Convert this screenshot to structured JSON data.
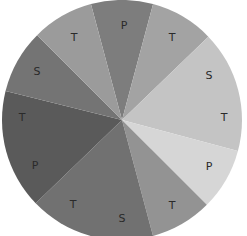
{
  "wheel": {
    "center": [
      122,
      120
    ],
    "radius": 120,
    "segments": [
      {
        "start": -15,
        "end": 15,
        "color": "#7d7d7d",
        "labels": [
          "P"
        ]
      },
      {
        "start": 15,
        "end": 46,
        "color": "#a3a3a3",
        "labels": [
          "T"
        ]
      },
      {
        "start": 46,
        "end": 105,
        "color": "#c4c4c4",
        "labels": [
          "S",
          "T"
        ]
      },
      {
        "start": 105,
        "end": 135,
        "color": "#d6d6d6",
        "labels": [
          "P"
        ]
      },
      {
        "start": 135,
        "end": 165,
        "color": "#939393",
        "labels": [
          "T"
        ]
      },
      {
        "start": 165,
        "end": 226,
        "color": "#717171",
        "labels": [
          "S",
          "T"
        ]
      },
      {
        "start": 226,
        "end": 284,
        "color": "#5a5a5a",
        "labels": [
          "P",
          "T"
        ]
      },
      {
        "start": 284,
        "end": 315,
        "color": "#747474",
        "labels": [
          "S"
        ]
      },
      {
        "start": 315,
        "end": 345,
        "color": "#9b9b9b",
        "labels": [
          "T"
        ]
      }
    ],
    "labels": [
      {
        "text": "P",
        "x": 124,
        "y": 26
      },
      {
        "text": "T",
        "x": 172,
        "y": 38
      },
      {
        "text": "S",
        "x": 209,
        "y": 76
      },
      {
        "text": "T",
        "x": 224,
        "y": 118
      },
      {
        "text": "P",
        "x": 209,
        "y": 167
      },
      {
        "text": "T",
        "x": 172,
        "y": 206
      },
      {
        "text": "S",
        "x": 122,
        "y": 219
      },
      {
        "text": "T",
        "x": 73,
        "y": 205
      },
      {
        "text": "P",
        "x": 35,
        "y": 166
      },
      {
        "text": "T",
        "x": 22,
        "y": 118
      },
      {
        "text": "S",
        "x": 37,
        "y": 72
      },
      {
        "text": "T",
        "x": 74,
        "y": 38
      }
    ]
  }
}
